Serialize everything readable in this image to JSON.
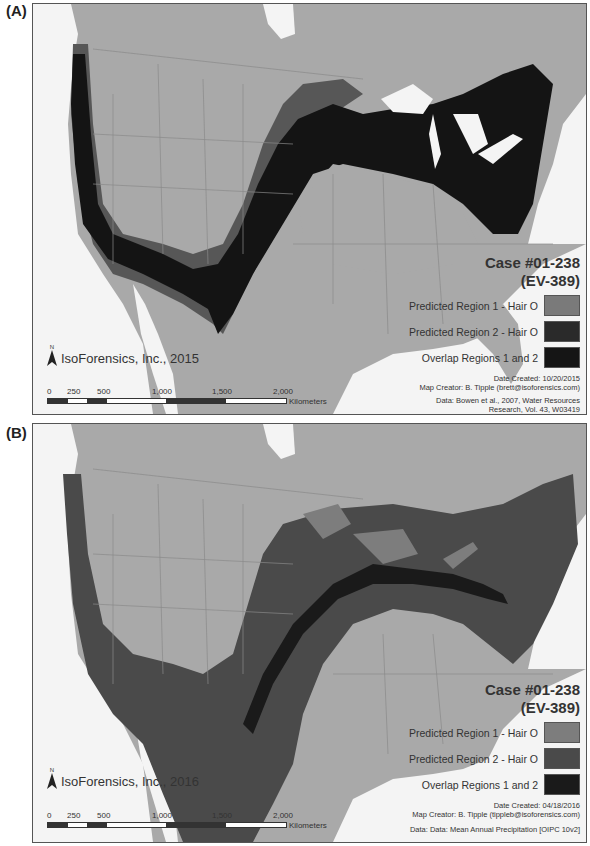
{
  "panels": [
    {
      "label": "(A)",
      "legend": {
        "case_title": "Case #01-238",
        "case_sub": "(EV-389)",
        "items": [
          {
            "label": "Predicted Region 1 - Hair O",
            "color": "#7a7a7a"
          },
          {
            "label": "Predicted Region 2 - Hair O",
            "color": "#2a2a2a"
          },
          {
            "label": "Overlap Regions 1 and 2",
            "color": "#151515"
          }
        ],
        "date_created": "Date Created: 10/20/2015",
        "map_creator": "Map Creator: B. Tipple (brett@isoforensics.com)",
        "data_source_1": "Data: Bowen et al., 2007, Water Resources",
        "data_source_2": "Research, Vol. 43, W03419"
      },
      "brand": "IsoForensics, Inc., 2015",
      "north": "N"
    },
    {
      "label": "(B)",
      "legend": {
        "case_title": "Case #01-238",
        "case_sub": "(EV-389)",
        "items": [
          {
            "label": "Predicted Region 1 - Hair O",
            "color": "#7d7d7d"
          },
          {
            "label": "Predicted Region 2 - Hair O",
            "color": "#4a4a4a"
          },
          {
            "label": "Overlap Regions 1 and 2",
            "color": "#1a1a1a"
          }
        ],
        "date_created": "Date Created: 04/18/2016",
        "map_creator": "Map Creator: B. Tipple (tippleb@isoforensics.com)",
        "data_source_1": "Data: Data: Mean Annual Precipitation [OIPC 10v2]",
        "data_source_2": ""
      },
      "brand": "IsoForensics, Inc., 2016",
      "north": "N"
    }
  ],
  "scale": {
    "ticks": [
      "0",
      "250",
      "500",
      "1,000",
      "1,500",
      "2,000"
    ],
    "unit": "Kilometers"
  },
  "colors": {
    "land": "#a9a9a9",
    "water": "#f4f4f4",
    "borders": "#8a8a8a"
  }
}
